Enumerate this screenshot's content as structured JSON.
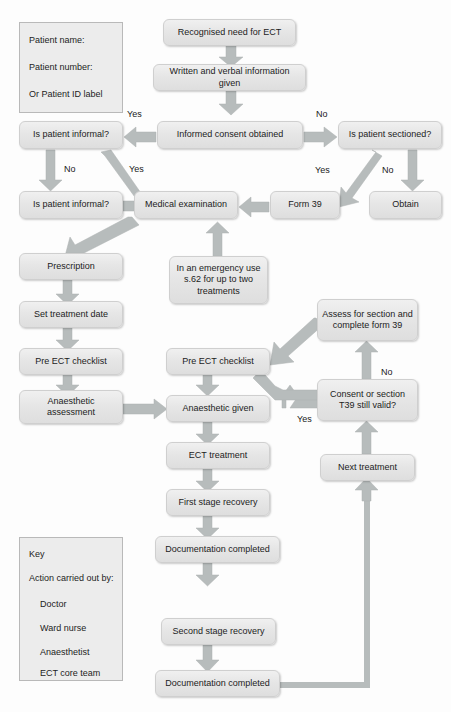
{
  "diagram": {
    "colors": {
      "node_fill": "#e6e6e6",
      "node_border": "#cfcfcf",
      "arrow": "#b7bcbc",
      "panel_fill": "#ececec",
      "text": "#1c1c1c",
      "background": "#fdfdfd"
    }
  },
  "patient_panel": {
    "name": "patient-details-panel",
    "lines": [
      "Patient name:",
      "Patient number:",
      "Or Patient ID label"
    ]
  },
  "key_panel": {
    "name": "key-legend-panel",
    "title": "Key",
    "subtitle": "Action carried out by:",
    "items": [
      "Doctor",
      "Ward nurse",
      "Anaesthetist",
      "ECT core team"
    ]
  },
  "nodes": {
    "recognised_need": "Recognised need for ECT",
    "written_verbal": "Written and verbal information given",
    "informed_consent": "Informed consent obtained",
    "is_informal_1": "Is patient informal?",
    "is_sectioned": "Is patient sectioned?",
    "is_informal_2": "Is patient informal?",
    "medical_exam": "Medical examination",
    "form_39": "Form 39",
    "obtain": "Obtain",
    "prescription": "Prescription",
    "set_treatment_date": "Set treatment date",
    "pre_ect_checklist_left": "Pre ECT checklist",
    "anaesthetic_assessment": "Anaesthetic assessment",
    "emergency_s62": "In an emergency use s.62 for up to two treatments",
    "pre_ect_checklist_mid": "Pre ECT checklist",
    "anaesthetic_given": "Anaesthetic given",
    "ect_treatment": "ECT treatment",
    "first_stage_recovery": "First stage recovery",
    "documentation_completed_1": "Documentation completed",
    "second_stage_recovery": "Second stage recovery",
    "documentation_completed_2": "Documentation completed",
    "assess_for_section": "Assess for section and complete form 39",
    "consent_or_section": "Consent or section T39 still valid?",
    "next_treatment": "Next treatment"
  },
  "branch_labels": {
    "consent_yes": "Yes",
    "consent_no": "No",
    "informal_no": "No",
    "informal_yes": "Yes",
    "sectioned_yes": "Yes",
    "sectioned_no": "No",
    "valid_no": "No",
    "valid_yes": "Yes"
  }
}
